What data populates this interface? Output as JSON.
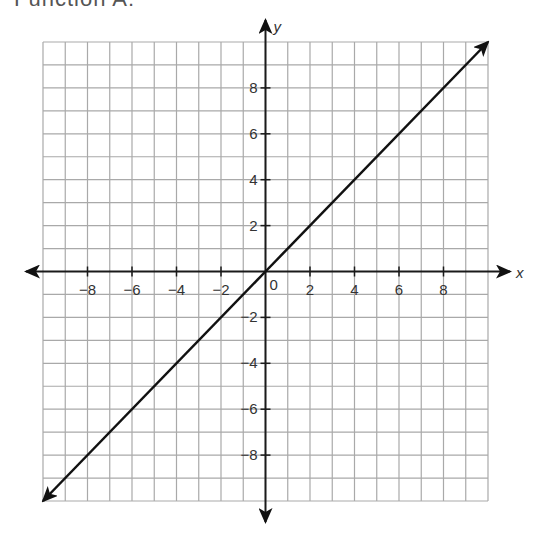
{
  "heading": "Function A:",
  "chart_data": {
    "type": "line",
    "title": "Function A",
    "xlabel": "x",
    "ylabel": "y",
    "xlim": [
      -10,
      10
    ],
    "ylim": [
      -10,
      10
    ],
    "grid": true,
    "x_ticks": [
      -8,
      -6,
      -4,
      -2,
      2,
      4,
      6,
      8
    ],
    "y_ticks": [
      8,
      6,
      4,
      2,
      -2,
      -4,
      -6,
      -8
    ],
    "origin_label": "0",
    "series": [
      {
        "name": "y = x",
        "x": [
          -10,
          10
        ],
        "y": [
          -10,
          10
        ],
        "arrows": "both"
      }
    ],
    "colors": {
      "grid": "#a9a9a9",
      "axis": "#1a1a1a",
      "line": "#111111"
    }
  }
}
